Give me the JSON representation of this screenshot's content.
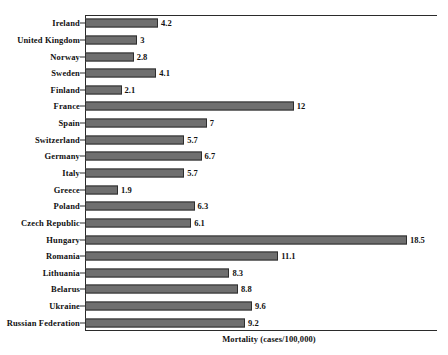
{
  "chart_data": {
    "type": "bar",
    "orientation": "horizontal",
    "title": "",
    "xlabel": "Mortality (cases/100,000)",
    "ylabel": "",
    "xlim": [
      0,
      20.2
    ],
    "grid": false,
    "legend": null,
    "bar_color": "#6f6f6f",
    "bar_edge_color": "#2e2e2e",
    "axis_color": "#2b2b2b",
    "text_color": "#111111",
    "categories": [
      "Ireland",
      "United Kingdom",
      "Norway",
      "Sweden",
      "Finland",
      "France",
      "Spain",
      "Switzerland",
      "Germany",
      "Italy",
      "Greece",
      "Poland",
      "Czech Republic",
      "Hungary",
      "Romania",
      "Lithuania",
      "Belarus",
      "Ukraine",
      "Russian Federation"
    ],
    "values": [
      4.2,
      3,
      2.8,
      4.1,
      2.1,
      12,
      7,
      5.7,
      6.7,
      5.7,
      1.9,
      6.3,
      6.1,
      18.5,
      11.1,
      8.3,
      8.8,
      9.6,
      9.2
    ],
    "value_labels": [
      "4.2",
      "3",
      "2.8",
      "4.1",
      "2.1",
      "12",
      "7",
      "5.7",
      "6.7",
      "5.7",
      "1.9",
      "6.3",
      "6.1",
      "18.5",
      "11.1",
      "8.3",
      "8.8",
      "9.6",
      "9.2"
    ]
  }
}
